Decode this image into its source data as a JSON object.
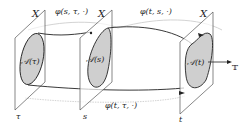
{
  "diagram": {
    "planes": [
      {
        "id": "tau",
        "space_label": "X",
        "time_label": "τ",
        "set_label": "𝒜(τ)"
      },
      {
        "id": "s",
        "space_label": "X",
        "time_label": "s",
        "set_label": "𝒜(s)"
      },
      {
        "id": "t",
        "space_label": "X",
        "time_label": "t",
        "set_label": "𝒜(t)"
      }
    ],
    "arrows": [
      {
        "id": "phi-s-tau",
        "label": "φ(s, τ, ·)"
      },
      {
        "id": "phi-t-s",
        "label": "φ(t, s, ·)"
      },
      {
        "id": "phi-t-tau",
        "label": "φ(t, τ, ·)"
      }
    ],
    "time_axis_label": "𝕋",
    "colors": {
      "set_fill": "#cfcfcf",
      "line": "#222222",
      "gray_arrow": "#bbbbbb"
    }
  }
}
